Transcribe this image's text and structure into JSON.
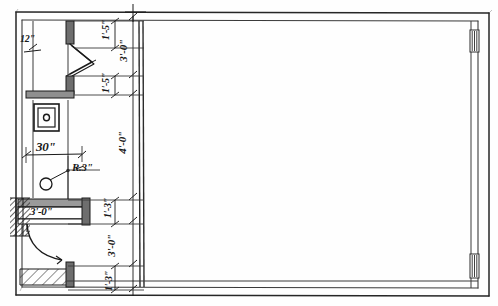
{
  "drawing": {
    "title": "Hand-drawn architectural floor plan sketch",
    "media": "pencil on paper",
    "paper_color": "#fefefe",
    "ink_color": "#1a1a1a",
    "wall_fill": "#8a8a8a"
  },
  "dimensions": [
    {
      "id": "d-12in",
      "text": "12\"",
      "orientation": "horizontal",
      "size": "sm",
      "x": 28,
      "y": 41
    },
    {
      "id": "d-top-1-5",
      "text": "1'-5\"",
      "orientation": "vertical",
      "size": "sm",
      "x": 106,
      "y": 31
    },
    {
      "id": "d-3-0-upper",
      "text": "3'-0\"",
      "orientation": "vertical",
      "size": "md",
      "x": 123,
      "y": 52
    },
    {
      "id": "d-mid-1-5",
      "text": "1'-5\"",
      "orientation": "vertical",
      "size": "sm",
      "x": 106,
      "y": 90
    },
    {
      "id": "d-4-0",
      "text": "4'-0\"",
      "orientation": "vertical",
      "size": "md",
      "x": 122,
      "y": 145
    },
    {
      "id": "d-30in",
      "text": "30\"",
      "orientation": "horizontal",
      "size": "lg",
      "x": 47,
      "y": 150
    },
    {
      "id": "d-r3in",
      "text": "R.3\"",
      "orientation": "horizontal",
      "size": "md",
      "x": 85,
      "y": 170
    },
    {
      "id": "d-low-1-3",
      "text": "1'-3\"",
      "orientation": "vertical",
      "size": "sm",
      "x": 108,
      "y": 210
    },
    {
      "id": "d-door-3-0",
      "text": "3'-0\"",
      "orientation": "horizontal",
      "size": "md",
      "x": 43,
      "y": 213
    },
    {
      "id": "d-3-0-lower",
      "text": "3'-0\"",
      "orientation": "vertical",
      "size": "md",
      "x": 111,
      "y": 248
    },
    {
      "id": "d-bot-1-3",
      "text": "1'-3\"",
      "orientation": "vertical",
      "size": "sm",
      "x": 109,
      "y": 283
    }
  ],
  "elements": {
    "bifold_door": "bifold-door-symbol",
    "swing_door": "swing-door-arc",
    "fixture": "square-fixture-symbol",
    "pivot": "radius-pivot-circle",
    "window_top": "window-opening-top",
    "window_bottom": "window-opening-bottom"
  },
  "annotations": {
    "outer_border": "outer-wall-outline",
    "inner_border": "inner-wall-outline"
  }
}
